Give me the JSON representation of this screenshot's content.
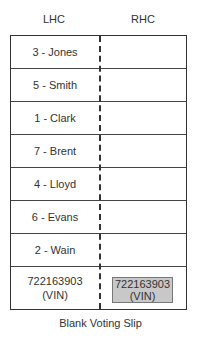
{
  "headers": {
    "lhc": "LHC",
    "rhc": "RHC"
  },
  "candidates": [
    "3 - Jones",
    "5 - Smith",
    "1 - Clark",
    "7 - Brent",
    "4 - Lloyd",
    "6 - Evans",
    "2 - Wain"
  ],
  "vin": {
    "number": "722163903",
    "label": "(VIN)",
    "box_color": "#c8c8c8"
  },
  "caption": "Blank Voting Slip"
}
